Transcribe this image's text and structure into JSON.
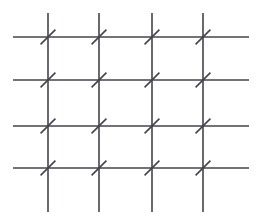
{
  "figure": {
    "width": 260,
    "height": 224,
    "background_color": "#ffffff"
  },
  "chart_data": {
    "type": "line",
    "title": "",
    "subtitle": "",
    "xlabel": "",
    "ylabel": "",
    "grid": true,
    "legend_position": "none",
    "xlim": [
      0,
      260
    ],
    "ylim": [
      0,
      224
    ],
    "annotations": [],
    "tick_labels": {
      "x": [],
      "y": []
    },
    "style": {
      "line_color": "#43434c",
      "line_width": 1.6,
      "tick_color": "#43434c",
      "tick_width": 1.6
    },
    "series": [
      {
        "name": "horizontal-lines",
        "orientation": "horizontal",
        "count": 4,
        "positions": [
          37,
          80,
          126,
          168
        ],
        "extent": [
          13,
          249
        ]
      },
      {
        "name": "vertical-lines",
        "orientation": "vertical",
        "count": 4,
        "positions": [
          48,
          99,
          152,
          203
        ],
        "extent": [
          13,
          212
        ]
      },
      {
        "name": "intersection-ticks",
        "orientation": "diagonal",
        "count": 16,
        "direction": "lower-left-to-upper-right",
        "angle_degrees": 45,
        "length": 21,
        "points": [
          {
            "x": 48,
            "y": 37
          },
          {
            "x": 99,
            "y": 37
          },
          {
            "x": 152,
            "y": 37
          },
          {
            "x": 203,
            "y": 37
          },
          {
            "x": 48,
            "y": 80
          },
          {
            "x": 99,
            "y": 80
          },
          {
            "x": 152,
            "y": 80
          },
          {
            "x": 203,
            "y": 80
          },
          {
            "x": 48,
            "y": 126
          },
          {
            "x": 99,
            "y": 126
          },
          {
            "x": 152,
            "y": 126
          },
          {
            "x": 203,
            "y": 126
          },
          {
            "x": 48,
            "y": 168
          },
          {
            "x": 99,
            "y": 168
          },
          {
            "x": 152,
            "y": 168
          },
          {
            "x": 203,
            "y": 168
          }
        ]
      }
    ]
  }
}
